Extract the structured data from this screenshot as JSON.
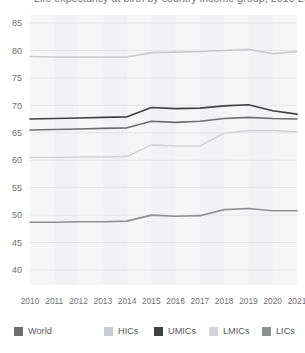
{
  "title": {
    "text": "Life expectancy at birth by country income group, 2010-2021",
    "visible_fragment": true
  },
  "chart_data": {
    "type": "line",
    "title": "Life expectancy at birth by country income group, 2010-2021",
    "xlabel": "",
    "ylabel": "",
    "x": [
      2010,
      2011,
      2012,
      2013,
      2014,
      2015,
      2016,
      2017,
      2018,
      2019,
      2020,
      2021
    ],
    "categories": [
      "2010",
      "2011",
      "2012",
      "2013",
      "2014",
      "2015",
      "2016",
      "2017",
      "2018",
      "2019",
      "2020",
      "2021"
    ],
    "ylim": [
      40,
      85
    ],
    "yticks": [
      40,
      45,
      50,
      55,
      60,
      65,
      70,
      75,
      80,
      85
    ],
    "ytick_labels": [
      "40",
      "45",
      "50",
      "55",
      "60",
      "65",
      "70",
      "75",
      "80",
      "85"
    ],
    "grid": true,
    "grid_axis": "y",
    "legend_position": "bottom",
    "series": [
      {
        "name": "World",
        "color": "#6d6e70",
        "values": [
          65.5,
          65.6,
          65.7,
          65.8,
          65.9,
          67.1,
          66.9,
          67.1,
          67.6,
          67.8,
          67.6,
          67.5
        ]
      },
      {
        "name": "HICs",
        "color": "#c9cacb",
        "values": [
          78.9,
          78.8,
          78.8,
          78.8,
          78.8,
          79.6,
          79.7,
          79.8,
          80.0,
          80.2,
          79.4,
          79.8
        ]
      },
      {
        "name": "UMICs",
        "color": "#3f4042",
        "values": [
          67.5,
          67.6,
          67.7,
          67.8,
          67.9,
          69.6,
          69.4,
          69.5,
          69.9,
          70.1,
          69.0,
          68.4
        ]
      },
      {
        "name": "LMICs",
        "color": "#d4d5d6",
        "values": [
          60.5,
          60.5,
          60.6,
          60.6,
          60.7,
          62.8,
          62.6,
          62.6,
          64.9,
          65.4,
          65.4,
          65.2
        ]
      },
      {
        "name": "LICs",
        "color": "#8e8f91",
        "values": [
          48.7,
          48.7,
          48.8,
          48.8,
          48.9,
          50.0,
          49.8,
          49.9,
          51.0,
          51.2,
          50.8,
          50.8
        ]
      }
    ]
  },
  "legend": {
    "items": [
      {
        "label": "World",
        "color": "#6d6e70",
        "x": 14
      },
      {
        "label": "HICs",
        "color": "#c9cacb",
        "x": 104
      },
      {
        "label": "UMICs",
        "color": "#3f4042",
        "x": 154
      },
      {
        "label": "LMICs",
        "color": "#d4d5d6",
        "x": 209
      },
      {
        "label": "LICs",
        "color": "#8e8f91",
        "x": 262
      }
    ]
  },
  "style": {
    "plot_bg": "#f6f6f7",
    "band_bg": "#f1f1f2",
    "grid_color": "#e4e4e5",
    "tick_text": "#6f7072"
  }
}
